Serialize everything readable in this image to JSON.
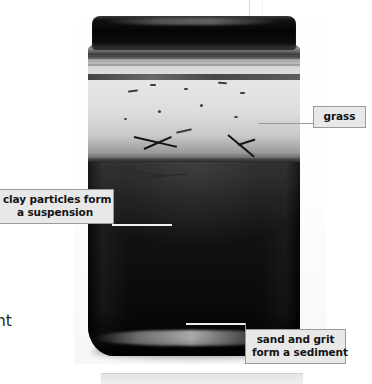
{
  "page": {
    "background_color": "#ffffff",
    "width": 372,
    "height": 384
  },
  "body_text": {
    "paragraph_top": "d\nabout\nse two\ndo not\nolids.",
    "paragraph_bottom": "s\nh\norce\nweight\nthe\nruct"
  },
  "figure": {
    "name": "jar-of-muddy-water-photograph",
    "layers": {
      "lid": "dark metal screw lid",
      "clear_water": "pale clear layer near the top",
      "muddy_water": "dark suspension filling most of the jar",
      "sediment": "dense black band at the base",
      "grass": "floating blades of grass at the water line"
    }
  },
  "callouts": [
    {
      "id": "grass",
      "label": "grass",
      "border_color": "#9a9a9a",
      "fill_color": "#e8e8e8",
      "position": "right"
    },
    {
      "id": "clay",
      "label": "clay particles form\na suspension",
      "border_color": "#9a9a9a",
      "fill_color": "#e8e8e8",
      "position": "left"
    },
    {
      "id": "sand",
      "label": "sand and grit\nform a sediment",
      "border_color": "#9a9a9a",
      "fill_color": "#e8e8e8",
      "position": "bottom-right"
    }
  ]
}
